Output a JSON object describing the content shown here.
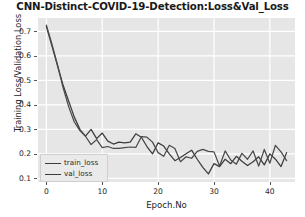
{
  "chart_data": {
    "type": "line",
    "title": "CNN-Distinct-COVID-19-Detection:Loss&Val_Loss",
    "xlabel": "Epoch.No",
    "ylabel": "Training Loss/Validation Loss",
    "xlim": [
      -1.5,
      44.5
    ],
    "ylim": [
      0.085,
      0.755
    ],
    "grid": true,
    "grid_color": "#ffffff",
    "plot_background": "#e6e6e6",
    "legend_position": "lower left",
    "xticks": [
      0,
      10,
      20,
      30,
      40
    ],
    "xtick_labels": [
      "0",
      "10",
      "20",
      "30",
      "40"
    ],
    "yticks": [
      0.1,
      0.2,
      0.3,
      0.4,
      0.5,
      0.6,
      0.7
    ],
    "ytick_labels": [
      "0.1",
      "0.2",
      "0.3",
      "0.4",
      "0.5",
      "0.6",
      "0.7"
    ],
    "x": [
      0,
      1,
      2,
      3,
      4,
      5,
      6,
      7,
      8,
      9,
      10,
      11,
      12,
      13,
      14,
      15,
      16,
      17,
      18,
      19,
      20,
      21,
      22,
      23,
      24,
      25,
      26,
      27,
      28,
      29,
      30,
      31,
      32,
      33,
      34,
      35,
      36,
      37,
      38,
      39,
      40,
      41,
      42,
      43
    ],
    "series": [
      {
        "name": "train_loss",
        "color": "#3c3c3c",
        "values": [
          0.72,
          0.64,
          0.56,
          0.48,
          0.415,
          0.35,
          0.3,
          0.272,
          0.3,
          0.262,
          0.285,
          0.252,
          0.24,
          0.248,
          0.245,
          0.248,
          0.282,
          0.268,
          0.23,
          0.2,
          0.245,
          0.232,
          0.2,
          0.172,
          0.185,
          0.2,
          0.215,
          0.178,
          0.145,
          0.118,
          0.16,
          0.148,
          0.178,
          0.16,
          0.19,
          0.17,
          0.152,
          0.168,
          0.188,
          0.155,
          0.2,
          0.178,
          0.148,
          0.205
        ]
      },
      {
        "name": "val_loss",
        "color": "#4a4a4a",
        "values": [
          0.726,
          0.648,
          0.562,
          0.47,
          0.392,
          0.33,
          0.295,
          0.272,
          0.238,
          0.258,
          0.225,
          0.23,
          0.222,
          0.222,
          0.225,
          0.228,
          0.226,
          0.27,
          0.268,
          0.248,
          0.205,
          0.19,
          0.235,
          0.222,
          0.168,
          0.188,
          0.182,
          0.21,
          0.218,
          0.21,
          0.208,
          0.15,
          0.212,
          0.175,
          0.158,
          0.202,
          0.178,
          0.212,
          0.15,
          0.218,
          0.162,
          0.235,
          0.208,
          0.172
        ]
      }
    ]
  },
  "legend": {
    "items": [
      {
        "label": "train_loss"
      },
      {
        "label": "val_loss"
      }
    ]
  }
}
